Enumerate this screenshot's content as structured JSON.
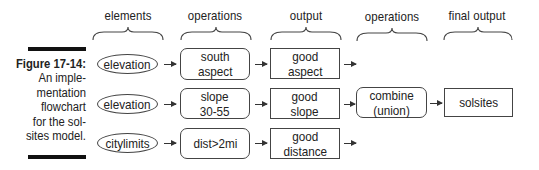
{
  "column_headers": [
    "elements",
    "operations",
    "output",
    "operations",
    "final output"
  ],
  "caption": {
    "figure_label": "Figure 17-14:",
    "lines": [
      "An imple-",
      "mentation",
      "flowchart",
      "for the sol-",
      "sites model."
    ]
  },
  "rows": [
    {
      "element": "elevation",
      "operation": [
        "south",
        "aspect"
      ],
      "output": [
        "good",
        "aspect"
      ]
    },
    {
      "element": "elevation",
      "operation": [
        "slope",
        "30-55"
      ],
      "output": [
        "good",
        "slope"
      ]
    },
    {
      "element": "citylimits",
      "operation": [
        "dist>2mi"
      ],
      "output": [
        "good",
        "distance"
      ]
    }
  ],
  "combine": [
    "combine",
    "(union)"
  ],
  "final_output": "solsites",
  "colors": {
    "line": "#444444",
    "bar": "#111111",
    "text": "#222222",
    "background": "#ffffff"
  }
}
